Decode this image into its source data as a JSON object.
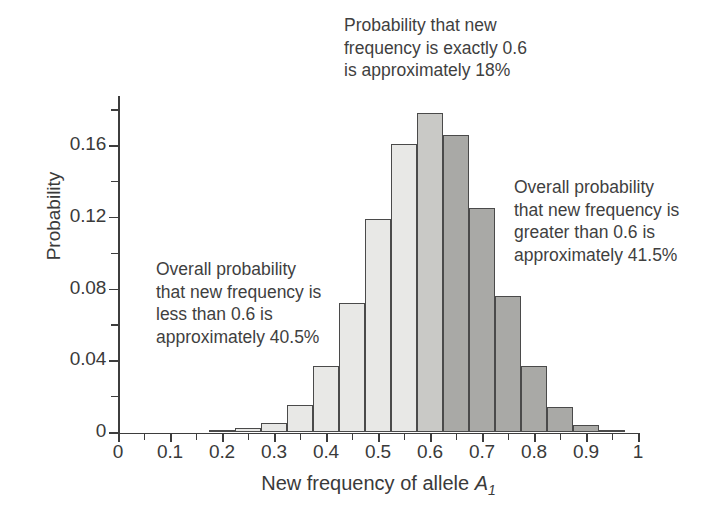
{
  "chart_data": {
    "type": "bar",
    "title": "",
    "subtitle": "",
    "xlabel": "New frequency of allele A1",
    "xlabel_parts": {
      "text": "New frequency of allele ",
      "italic": "A",
      "subscript": "1"
    },
    "ylabel": "Probability",
    "xlim": [
      0,
      1
    ],
    "ylim": [
      0,
      0.1875
    ],
    "grid": false,
    "legend": "none",
    "bin_width": 0.05,
    "x_tick_labels": [
      "0",
      "0.1",
      "0.2",
      "0.3",
      "0.4",
      "0.5",
      "0.6",
      "0.7",
      "0.8",
      "0.9",
      "1"
    ],
    "x_tick_values": [
      0,
      0.1,
      0.2,
      0.3,
      0.4,
      0.5,
      0.6,
      0.7,
      0.8,
      0.9,
      1
    ],
    "x_minor_tick_values": [
      0.05,
      0.15,
      0.25,
      0.35,
      0.45,
      0.55,
      0.65,
      0.75,
      0.85,
      0.95
    ],
    "y_tick_labels": [
      "0",
      "0.04",
      "0.08",
      "0.12",
      "0.16"
    ],
    "y_tick_values": [
      0,
      0.04,
      0.08,
      0.12,
      0.16
    ],
    "y_minor_tick_values": [
      0.02,
      0.06,
      0.1,
      0.14,
      0.18
    ],
    "categories": [
      "0.175-0.225",
      "0.225-0.275",
      "0.275-0.325",
      "0.325-0.375",
      "0.375-0.425",
      "0.425-0.475",
      "0.475-0.525",
      "0.525-0.575",
      "0.575-0.625",
      "0.625-0.675",
      "0.675-0.725",
      "0.725-0.775",
      "0.775-0.825",
      "0.825-0.875",
      "0.875-0.925",
      "0.925-0.975"
    ],
    "bins": [
      {
        "center": 0.2,
        "start": 0.175,
        "end": 0.225,
        "value": 0.001,
        "group": "less"
      },
      {
        "center": 0.25,
        "start": 0.225,
        "end": 0.275,
        "value": 0.002,
        "group": "less"
      },
      {
        "center": 0.3,
        "start": 0.275,
        "end": 0.325,
        "value": 0.005,
        "group": "less"
      },
      {
        "center": 0.35,
        "start": 0.325,
        "end": 0.375,
        "value": 0.015,
        "group": "less"
      },
      {
        "center": 0.4,
        "start": 0.375,
        "end": 0.425,
        "value": 0.037,
        "group": "less"
      },
      {
        "center": 0.45,
        "start": 0.425,
        "end": 0.475,
        "value": 0.072,
        "group": "less"
      },
      {
        "center": 0.5,
        "start": 0.475,
        "end": 0.525,
        "value": 0.119,
        "group": "less"
      },
      {
        "center": 0.55,
        "start": 0.525,
        "end": 0.575,
        "value": 0.161,
        "group": "less"
      },
      {
        "center": 0.6,
        "start": 0.575,
        "end": 0.625,
        "value": 0.178,
        "group": "exact"
      },
      {
        "center": 0.65,
        "start": 0.625,
        "end": 0.675,
        "value": 0.166,
        "group": "greater"
      },
      {
        "center": 0.7,
        "start": 0.675,
        "end": 0.725,
        "value": 0.125,
        "group": "greater"
      },
      {
        "center": 0.75,
        "start": 0.725,
        "end": 0.775,
        "value": 0.076,
        "group": "greater"
      },
      {
        "center": 0.8,
        "start": 0.775,
        "end": 0.825,
        "value": 0.037,
        "group": "greater"
      },
      {
        "center": 0.85,
        "start": 0.825,
        "end": 0.875,
        "value": 0.014,
        "group": "greater"
      },
      {
        "center": 0.9,
        "start": 0.875,
        "end": 0.925,
        "value": 0.004,
        "group": "greater"
      },
      {
        "center": 0.95,
        "start": 0.925,
        "end": 0.975,
        "value": 0.001,
        "group": "greater"
      }
    ],
    "values": [
      0.001,
      0.002,
      0.005,
      0.015,
      0.037,
      0.072,
      0.119,
      0.161,
      0.178,
      0.166,
      0.125,
      0.076,
      0.037,
      0.014,
      0.004,
      0.001
    ],
    "group_colors": {
      "less": "#e8e8e6",
      "exact": "#c9c9c6",
      "greater": "#a9a9a6",
      "bar_border": "#4a4a4a"
    },
    "annotations": [
      {
        "id": "top",
        "text": "Probability that new\nfrequency is exactly 0.6\nis approximately 18%",
        "value": 18,
        "unit": "%",
        "refers_to": "exact"
      },
      {
        "id": "left",
        "text": "Overall probability\nthat new frequency is\nless than 0.6 is\napproximately 40.5%",
        "value": 40.5,
        "unit": "%",
        "refers_to": "less"
      },
      {
        "id": "right",
        "text": "Overall probability\nthat new frequency is\ngreater than 0.6 is\napproximately 41.5%",
        "value": 41.5,
        "unit": "%",
        "refers_to": "greater"
      }
    ]
  },
  "figure": {
    "background_color": "#ffffff",
    "axis_color": "#3d3d3d",
    "text_color": "#3a3a3a"
  }
}
